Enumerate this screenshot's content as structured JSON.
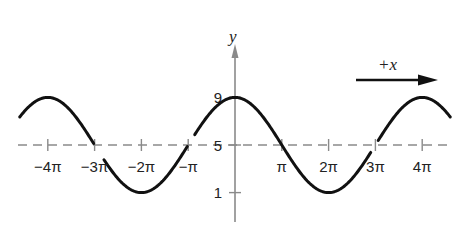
{
  "chart_data": {
    "type": "line",
    "title": "",
    "function": "y = 5 + 4 cos(x/2)",
    "xlabel": "",
    "ylabel": "y",
    "x_range_pi": [
      -4.6,
      4.6
    ],
    "ylim": [
      1,
      9
    ],
    "midline": 5,
    "amplitude": 4,
    "period_pi": 4,
    "x_ticks": [
      {
        "pi": -4,
        "label": "−4π"
      },
      {
        "pi": -3,
        "label": "−3π"
      },
      {
        "pi": -2,
        "label": "−2π"
      },
      {
        "pi": -1,
        "label": "−π"
      },
      {
        "pi": 1,
        "label": "π"
      },
      {
        "pi": 2,
        "label": "2π"
      },
      {
        "pi": 3,
        "label": "3π"
      },
      {
        "pi": 4,
        "label": "4π"
      }
    ],
    "y_ticks": [
      {
        "value": 9,
        "label": "9"
      },
      {
        "value": 5,
        "label": "5"
      },
      {
        "value": 1,
        "label": "1"
      }
    ],
    "key_points": [
      {
        "x_pi": -4,
        "y": 9
      },
      {
        "x_pi": -2,
        "y": 1
      },
      {
        "x_pi": 0,
        "y": 9
      },
      {
        "x_pi": 2,
        "y": 1
      },
      {
        "x_pi": 4,
        "y": 9
      }
    ],
    "annotations": [
      {
        "text": "+x",
        "type": "arrow",
        "direction": "right"
      }
    ],
    "grid": false,
    "legend": null,
    "colors": {
      "curve": "#111111",
      "midline": "#8a8a8a",
      "axis": "#8a8a8a",
      "text": "#222222"
    }
  },
  "labels": {
    "y_axis": "y",
    "direction": "+x"
  }
}
